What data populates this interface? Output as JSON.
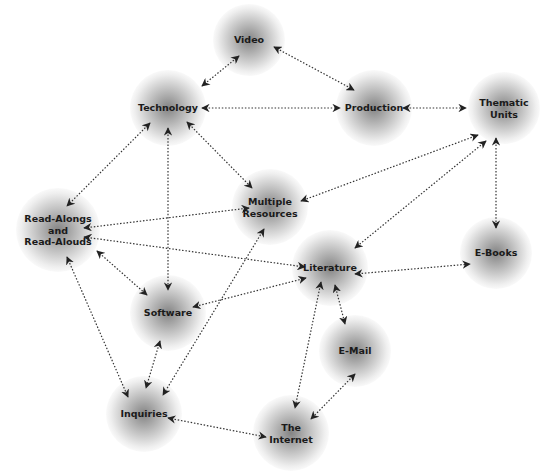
{
  "diagram": {
    "nodes": [
      {
        "id": "video",
        "label": "Video",
        "x": 249,
        "y": 40,
        "r": 36
      },
      {
        "id": "technology",
        "label": "Technology",
        "x": 168,
        "y": 108,
        "r": 38
      },
      {
        "id": "production",
        "label": "Production",
        "x": 374,
        "y": 108,
        "r": 38
      },
      {
        "id": "thematic",
        "label": "Thematic\nUnits",
        "x": 504,
        "y": 108,
        "r": 36
      },
      {
        "id": "multiple",
        "label": "Multiple\nResources",
        "x": 270,
        "y": 207,
        "r": 38
      },
      {
        "id": "readalongs",
        "label": "Read-Alongs\nand\nRead-Alouds",
        "x": 58,
        "y": 230,
        "r": 42
      },
      {
        "id": "literature",
        "label": "Literature",
        "x": 330,
        "y": 268,
        "r": 38
      },
      {
        "id": "ebooks",
        "label": "E-Books",
        "x": 496,
        "y": 253,
        "r": 36
      },
      {
        "id": "software",
        "label": "Software",
        "x": 168,
        "y": 313,
        "r": 38
      },
      {
        "id": "email",
        "label": "E-Mail",
        "x": 355,
        "y": 351,
        "r": 36
      },
      {
        "id": "inquiries",
        "label": "Inquiries",
        "x": 144,
        "y": 414,
        "r": 38
      },
      {
        "id": "internet",
        "label": "The\nInternet",
        "x": 291,
        "y": 433,
        "r": 38
      }
    ],
    "edges": [
      {
        "from": [
          202,
          86
        ],
        "to": [
          239,
          56
        ]
      },
      {
        "from": [
          274,
          47
        ],
        "to": [
          354,
          90
        ]
      },
      {
        "from": [
          202,
          108
        ],
        "to": [
          340,
          108
        ]
      },
      {
        "from": [
          403,
          108
        ],
        "to": [
          466,
          108
        ]
      },
      {
        "from": [
          478,
          135
        ],
        "to": [
          301,
          201
        ]
      },
      {
        "from": [
          486,
          141
        ],
        "to": [
          355,
          248
        ]
      },
      {
        "from": [
          496,
          138
        ],
        "to": [
          496,
          228
        ]
      },
      {
        "from": [
          150,
          123
        ],
        "to": [
          67,
          206
        ]
      },
      {
        "from": [
          168,
          128
        ],
        "to": [
          168,
          290
        ]
      },
      {
        "from": [
          187,
          122
        ],
        "to": [
          252,
          188
        ]
      },
      {
        "from": [
          84,
          228
        ],
        "to": [
          249,
          208
        ]
      },
      {
        "from": [
          84,
          237
        ],
        "to": [
          305,
          267
        ]
      },
      {
        "from": [
          97,
          251
        ],
        "to": [
          147,
          295
        ]
      },
      {
        "from": [
          67,
          257
        ],
        "to": [
          128,
          397
        ]
      },
      {
        "from": [
          264,
          229
        ],
        "to": [
          163,
          395
        ]
      },
      {
        "from": [
          306,
          278
        ],
        "to": [
          193,
          307
        ]
      },
      {
        "from": [
          355,
          274
        ],
        "to": [
          470,
          264
        ]
      },
      {
        "from": [
          160,
          341
        ],
        "to": [
          146,
          388
        ]
      },
      {
        "from": [
          321,
          282
        ],
        "to": [
          295,
          408
        ]
      },
      {
        "from": [
          335,
          285
        ],
        "to": [
          345,
          324
        ]
      },
      {
        "from": [
          355,
          374
        ],
        "to": [
          311,
          419
        ]
      },
      {
        "from": [
          168,
          418
        ],
        "to": [
          266,
          437
        ]
      }
    ]
  }
}
